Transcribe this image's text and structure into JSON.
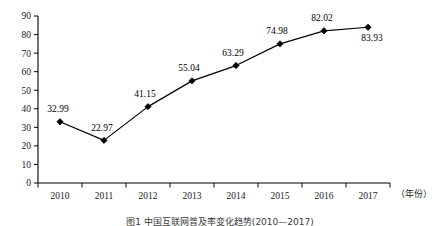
{
  "chart_data": {
    "type": "line",
    "title": "",
    "xlabel": "（年份）",
    "ylabel": "",
    "categories": [
      "2010",
      "2011",
      "2012",
      "2013",
      "2014",
      "2015",
      "2016",
      "2017"
    ],
    "values": [
      32.99,
      22.97,
      41.15,
      55.04,
      63.29,
      74.98,
      82.02,
      83.93
    ],
    "point_labels": [
      "32.99",
      "22.97",
      "41.15",
      "55.04",
      "63.29",
      "74.98",
      "82.02",
      "83.93"
    ],
    "series": [
      {
        "name": "",
        "values": [
          32.99,
          22.97,
          41.15,
          55.04,
          63.29,
          74.98,
          82.02,
          83.93
        ]
      }
    ],
    "ylim": [
      0,
      90
    ],
    "yticks": [
      0,
      10,
      20,
      30,
      40,
      50,
      60,
      70,
      80,
      90
    ],
    "ytick_labels": [
      "0",
      "10",
      "20",
      "30",
      "40",
      "50",
      "60",
      "70",
      "80",
      "90"
    ],
    "grid": false,
    "legend": false,
    "legend_position": "none",
    "marker": "diamond",
    "line_color": "#000000",
    "marker_color": "#000000",
    "background": "#ffffff"
  },
  "axis": {
    "x_axis_name": "（年份）"
  },
  "caption": {
    "text": "图1  中国互联网普及率变化趋势(2010—2017)"
  }
}
